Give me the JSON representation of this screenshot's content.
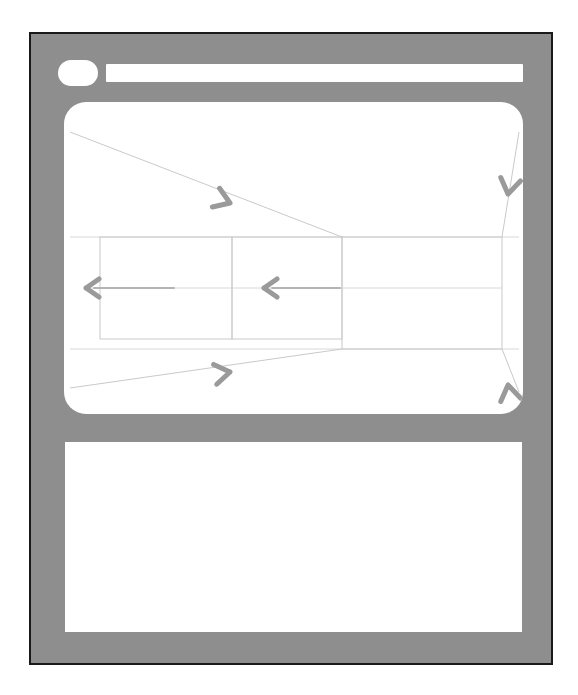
{
  "window": {
    "frame_color": "#8e8e8e",
    "border_color": "#1a1a1a",
    "panel_color": "#ffffff"
  },
  "titlebar": {
    "dot_label": "",
    "address_value": "",
    "address_placeholder": ""
  },
  "viewport": {
    "label": "",
    "line_color": "#c9c9c9",
    "arrow_color": "#9a9a9a"
  },
  "content": {
    "label": ""
  },
  "diagram": {
    "type": "perspective-convergence-wireframe",
    "rectangles": [
      {
        "name": "inner-small-rect",
        "x": 36,
        "y": 135,
        "w": 132,
        "h": 102
      },
      {
        "name": "middle-rect",
        "x": 168,
        "y": 135,
        "w": 110,
        "h": 102
      },
      {
        "name": "outer-large-rect",
        "x": 278,
        "y": 135,
        "w": 160,
        "h": 112
      }
    ],
    "converge_lines": [
      {
        "name": "top-left-diagonal",
        "x1": 6,
        "y1": 30,
        "x2": 278,
        "y2": 135
      },
      {
        "name": "bottom-left-diagonal",
        "x1": 6,
        "y1": 286,
        "x2": 278,
        "y2": 247
      },
      {
        "name": "top-right-diagonal",
        "x1": 455,
        "y1": 30,
        "x2": 438,
        "y2": 135
      },
      {
        "name": "bottom-right-diagonal",
        "x1": 455,
        "y1": 290,
        "x2": 438,
        "y2": 247
      }
    ],
    "arrows": [
      {
        "name": "arrow-top-diagonal-right",
        "direction": "right-down",
        "x": 148,
        "y": 92
      },
      {
        "name": "arrow-bottom-diagonal-right",
        "direction": "right-up",
        "x": 148,
        "y": 262
      },
      {
        "name": "arrow-inner-left",
        "direction": "left",
        "x": 22,
        "y": 186
      },
      {
        "name": "arrow-middle-left",
        "direction": "left",
        "x": 200,
        "y": 186
      },
      {
        "name": "arrow-top-right-down",
        "direction": "down-left",
        "x": 448,
        "y": 80
      },
      {
        "name": "arrow-bottom-right-up",
        "direction": "up-left",
        "x": 448,
        "y": 292
      }
    ],
    "guide_lines": [
      {
        "name": "horizontal-center-guide",
        "x1": 22,
        "y1": 186,
        "x2": 438,
        "y2": 186
      },
      {
        "name": "top-edge-guide",
        "x1": 6,
        "y1": 135,
        "x2": 455,
        "y2": 135
      },
      {
        "name": "bottom-edge-guide",
        "x1": 6,
        "y1": 247,
        "x2": 455,
        "y2": 247
      }
    ]
  }
}
